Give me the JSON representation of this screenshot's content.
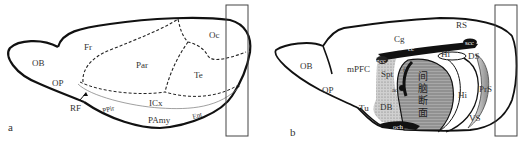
{
  "figure": {
    "panel_a": {
      "label": "a",
      "regions": {
        "ob": "OB",
        "op": "OP",
        "rf": "RF",
        "fr": "Fr",
        "par": "Par",
        "oc": "Oc",
        "te": "Te",
        "icx": "ICx",
        "ppir": "PPir",
        "pamy": "PAmy",
        "ent": "Ent"
      }
    },
    "panel_b": {
      "label": "b",
      "regions": {
        "ob": "OB",
        "op": "OP",
        "mpfc": "mPFC",
        "tu": "Tu",
        "cg": "Cg",
        "rs": "RS",
        "cc": "cc",
        "gcc": "gcc",
        "scc": "scc",
        "spt": "Spt",
        "f": "f",
        "ac": "ac",
        "db": "DB",
        "och": "och",
        "hi_top": "Hi",
        "ds": "DS",
        "hi": "Hi",
        "pros": "PrS",
        "vs": "VS"
      },
      "diencephalon_section": [
        "间",
        "脑",
        "断",
        "面"
      ]
    },
    "colors": {
      "outline": "#111111",
      "dashed": "#222222",
      "septal_fill": "#bdbdbd",
      "diencephalon_fill": "#9a9a9a",
      "white_matter": "#111111"
    }
  }
}
